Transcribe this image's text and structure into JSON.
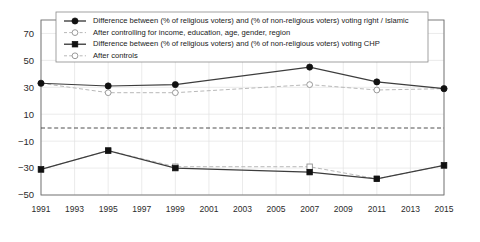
{
  "chart_data": {
    "type": "line",
    "title": "",
    "subtitle": "",
    "xlabel": "",
    "ylabel": "",
    "xlim": [
      1991,
      2015
    ],
    "ylim": [
      -50,
      80
    ],
    "yticks": [
      70,
      50,
      30,
      10,
      -10,
      -30,
      -50
    ],
    "ytick_labels": [
      "70",
      "50",
      "30",
      "10",
      "−10",
      "−30",
      "−50"
    ],
    "xticks": [
      1991,
      1993,
      1995,
      1997,
      1999,
      2001,
      2003,
      2005,
      2007,
      2009,
      2011,
      2013,
      2015
    ],
    "xtick_labels": [
      "1991",
      "1993",
      "1995",
      "1997",
      "1999",
      "2001",
      "2003",
      "2005",
      "2007",
      "2009",
      "2011",
      "2013",
      "2015"
    ],
    "grid": true,
    "legend_position": "top-inside",
    "reference_lines": [
      {
        "y": 0,
        "style": "dashed",
        "color": "#3a3a3a"
      }
    ],
    "x": [
      1991,
      1995,
      1999,
      2007,
      2011,
      2015
    ],
    "series": [
      {
        "name": "Difference between (% of religious voters) and (% of non-religious voters) voting right / Islamic",
        "marker": "filled-circle",
        "line": "solid",
        "color": "#3d3d3d",
        "values": [
          33,
          31,
          32,
          45,
          34,
          29
        ]
      },
      {
        "name": "After controlling for income, education, age, gender, region",
        "marker": "open-circle",
        "line": "dashed",
        "color": "#b4b4b4",
        "values": [
          33,
          26,
          26,
          32,
          28,
          29
        ]
      },
      {
        "name": "Difference between (% of religious voters) and (% of non-religious voters) voting CHP",
        "marker": "filled-square",
        "line": "solid",
        "color": "#3d3d3d",
        "values": [
          -31,
          -17,
          -30,
          -33,
          -38,
          -28
        ]
      },
      {
        "name": "After controls",
        "marker": "open-square",
        "line": "dashed",
        "color": "#b4b4b4",
        "values": [
          -31,
          -17,
          -29,
          -29,
          -38,
          -28
        ]
      }
    ]
  },
  "legend": {
    "entries": [
      {
        "label": "Difference between (% of religious voters) and (% of non-religious voters) voting right / Islamic",
        "marker": "filled-circle",
        "line": "solid"
      },
      {
        "label": "After controlling for income, education, age, gender, region",
        "marker": "open-circle",
        "line": "dashed"
      },
      {
        "label": "Difference between (% of religious voters) and (% of non-religious voters) voting CHP",
        "marker": "filled-square",
        "line": "solid"
      },
      {
        "label": "After controls",
        "marker": "open-circle",
        "line": "dashed"
      }
    ]
  },
  "colors": {
    "series_dark": "#3d3d3d",
    "series_light": "#b4b4b4",
    "grid": "#e2e2e2",
    "frame": "#6d6d6d",
    "text": "#2b2b2b",
    "background": "#ffffff"
  }
}
